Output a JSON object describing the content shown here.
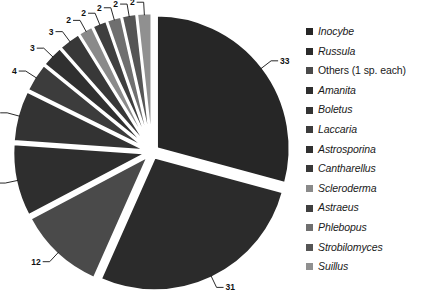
{
  "chart_data": {
    "type": "pie",
    "title": "",
    "xlabel": "",
    "ylabel": "",
    "grid": false,
    "legend_position": "right",
    "total": 113,
    "categories": [
      "Inocybe",
      "Russula",
      "Others (1 sp. each)",
      "Amanita",
      "Boletus",
      "Laccaria",
      "Astrosporina",
      "Cantharellus",
      "Scleroderma",
      "Astraeus",
      "Phlebopus",
      "Strobilomyces",
      "Suillus"
    ],
    "values": [
      33,
      31,
      12,
      10,
      7,
      4,
      3,
      3,
      2,
      2,
      2,
      2,
      2
    ],
    "labels": [
      "33",
      "31",
      "12",
      "10",
      "7",
      "4",
      "3",
      "3",
      "2",
      "2",
      "2",
      "2",
      "2"
    ],
    "colors": [
      "#262626",
      "#2b2b2b",
      "#4a4a4a",
      "#2e2e2e",
      "#333333",
      "#3c3c3c",
      "#303030",
      "#383838",
      "#8a8a8a",
      "#3f3f3f",
      "#6f6f6f",
      "#555555",
      "#909090"
    ],
    "exploded": true
  },
  "legend": {
    "items": [
      {
        "label": "Inocybe",
        "italic": true,
        "color": "#262626"
      },
      {
        "label": "Russula",
        "italic": true,
        "color": "#2b2b2b"
      },
      {
        "label": "Others (1 sp. each)",
        "italic": false,
        "color": "#4a4a4a"
      },
      {
        "label": "Amanita",
        "italic": true,
        "color": "#2e2e2e"
      },
      {
        "label": "Boletus",
        "italic": true,
        "color": "#333333"
      },
      {
        "label": "Laccaria",
        "italic": true,
        "color": "#3c3c3c"
      },
      {
        "label": "Astrosporina",
        "italic": true,
        "color": "#303030"
      },
      {
        "label": "Cantharellus",
        "italic": true,
        "color": "#383838"
      },
      {
        "label": "Scleroderma",
        "italic": true,
        "color": "#8a8a8a"
      },
      {
        "label": "Astraeus",
        "italic": true,
        "color": "#3f3f3f"
      },
      {
        "label": "Phlebopus",
        "italic": true,
        "color": "#6f6f6f"
      },
      {
        "label": "Strobilomyces",
        "italic": true,
        "color": "#555555"
      },
      {
        "label": "Suillus",
        "italic": true,
        "color": "#909090"
      }
    ]
  }
}
